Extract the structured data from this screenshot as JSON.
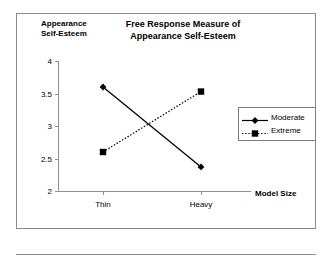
{
  "chart": {
    "title": "Free Response Measure of\nAppearance Self-Esteem",
    "y_axis_title": "Appearance\nSelf-Esteem",
    "x_axis_title": "Model Size"
  },
  "chart_data": {
    "type": "line",
    "title": "Free Response Measure of Appearance Self-Esteem",
    "xlabel": "Model Size",
    "ylabel": "Appearance Self-Esteem",
    "categories": [
      "Thin",
      "Heavy"
    ],
    "series": [
      {
        "name": "Moderate",
        "values": [
          3.6,
          2.37
        ],
        "line_style": "solid",
        "marker": "diamond",
        "color": "#000000"
      },
      {
        "name": "Extreme",
        "values": [
          2.6,
          3.53
        ],
        "line_style": "dotted",
        "marker": "square",
        "color": "#000000"
      }
    ],
    "ylim": [
      2,
      4
    ],
    "yticks": [
      2,
      2.5,
      3,
      3.5,
      4
    ],
    "ytick_labels": [
      "2",
      "2.5",
      "3",
      "3.5",
      "4"
    ],
    "grid": false,
    "legend_position": "right"
  }
}
